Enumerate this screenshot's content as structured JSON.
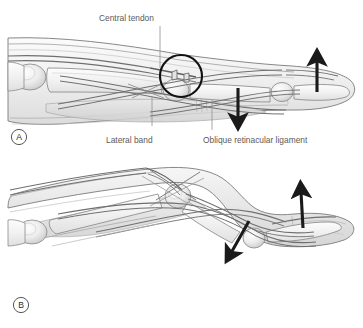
{
  "figure": {
    "background_color": "#ffffff",
    "ink_color": "#4a4a4a",
    "outline_color": "#6b6b6b",
    "arrow_color": "#1a1a1a",
    "leader_color": "#8a8a8a",
    "tissue_fill_light": "#f4f4f4",
    "tissue_fill_mid": "#e6e6e6",
    "tissue_fill_dark": "#d2d2d2",
    "bone_fill": "#efefef"
  },
  "panel_a": {
    "letter": "A",
    "labels": {
      "central_tendon": "Central tendon",
      "lateral_band": "Lateral band",
      "oblique_retinacular_ligament": "Oblique retinacular ligament"
    },
    "annotations": {
      "rupture_circle": "rupture-highlight-circle",
      "arrow_down": "middle-phalanx-down-arrow",
      "arrow_up": "distal-phalanx-up-arrow"
    }
  },
  "panel_b": {
    "letter": "B",
    "annotations": {
      "arrow_diagonal_down": "pip-volar-subluxation-arrow",
      "arrow_up": "dip-hyperextension-arrow"
    }
  }
}
